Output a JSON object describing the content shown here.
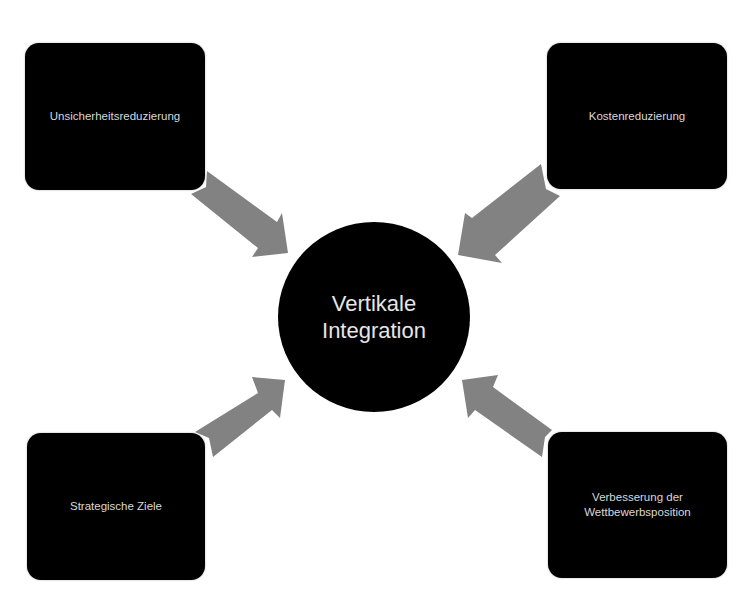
{
  "diagram": {
    "center": {
      "line1": "Vertikale",
      "line2": "Integration"
    },
    "boxes": {
      "top_left": "Unsicherheitsreduzierung",
      "top_right": "Kostenreduzierung",
      "bottom_left": "Strategische Ziele",
      "bottom_right_line1": "Verbesserung der",
      "bottom_right_line2": "Wettbewerbsposition"
    },
    "arrows": [
      {
        "from": "Unsicherheitsreduzierung",
        "to": "Vertikale Integration"
      },
      {
        "from": "Kostenreduzierung",
        "to": "Vertikale Integration"
      },
      {
        "from": "Strategische Ziele",
        "to": "Vertikale Integration"
      },
      {
        "from": "Verbesserung der Wettbewerbsposition",
        "to": "Vertikale Integration"
      }
    ],
    "colors": {
      "box_fill": "#000000",
      "box_text": "#d9d9d9",
      "arrow_fill": "#828282",
      "background": "#ffffff"
    }
  }
}
